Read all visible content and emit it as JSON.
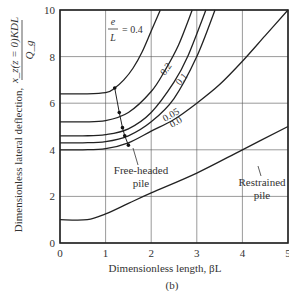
{
  "chart_data": {
    "type": "line",
    "panel_label": "(b)",
    "xlabel": "Dimensionless length, βL",
    "ylabel": "Dimensionless lateral deflection, x_z(z = 0)KDL / Q_g",
    "ylabel_text": "Dimensionless lateral deflection,",
    "ylabel_fraction_num": "x_z(z = 0)KDL",
    "ylabel_fraction_den": "Q_g",
    "xlim": [
      0,
      5
    ],
    "ylim": [
      0,
      10
    ],
    "xticks": [
      "0",
      "1",
      "2",
      "3",
      "4",
      "5"
    ],
    "yticks": [
      "0",
      "2",
      "4",
      "6",
      "8",
      "10"
    ],
    "grid": true,
    "param_label": "e/L = 0.4",
    "param_e": "e",
    "param_L": "L",
    "param_eq": "= 0.4",
    "annotations": [
      {
        "text": "Free-headed",
        "text2": "pile"
      },
      {
        "text": "Restrained",
        "text2": "pile"
      }
    ],
    "series": [
      {
        "name": "e/L = 0.4",
        "group": "Free-headed pile",
        "label": "0.4",
        "x": [
          0,
          0.5,
          1.0,
          1.2,
          1.4,
          1.6,
          1.8,
          2.0,
          2.2
        ],
        "y": [
          6.4,
          6.4,
          6.45,
          6.65,
          7.0,
          7.5,
          8.2,
          9.1,
          10.0
        ]
      },
      {
        "name": "e/L = 0.2",
        "group": "Free-headed pile",
        "label": "0.2",
        "x": [
          0,
          0.5,
          1.0,
          1.5,
          2.0,
          2.3,
          2.6,
          2.9
        ],
        "y": [
          5.2,
          5.2,
          5.25,
          5.6,
          6.5,
          7.4,
          8.5,
          10.0
        ]
      },
      {
        "name": "e/L = 0.1",
        "group": "Free-headed pile",
        "label": "0.1",
        "x": [
          0,
          0.5,
          1.0,
          1.5,
          2.0,
          2.5,
          2.8,
          3.2
        ],
        "y": [
          4.6,
          4.6,
          4.65,
          4.9,
          5.6,
          6.9,
          8.0,
          10.0
        ]
      },
      {
        "name": "e/L = 0.05",
        "group": "Free-headed pile",
        "label": "0.05",
        "x": [
          0,
          0.5,
          1.0,
          1.5,
          2.0,
          2.5,
          3.0,
          3.4
        ],
        "y": [
          4.3,
          4.3,
          4.35,
          4.6,
          5.2,
          6.2,
          8.0,
          10.0
        ]
      },
      {
        "name": "e/L = 0.0",
        "group": "Free-headed pile",
        "label": "0.0",
        "x": [
          0,
          0.5,
          1.0,
          1.5,
          2.0,
          2.5,
          3.0,
          3.5,
          4.0,
          4.5,
          5.0
        ],
        "y": [
          4.0,
          4.0,
          4.05,
          4.3,
          4.8,
          5.3,
          6.0,
          6.8,
          7.8,
          8.9,
          10.0
        ]
      },
      {
        "name": "Restrained pile",
        "group": "Restrained pile",
        "label": "",
        "x": [
          0,
          0.6,
          1.0,
          1.5,
          2.0,
          3.0,
          4.0,
          5.0
        ],
        "y": [
          1.0,
          1.0,
          1.25,
          1.7,
          2.15,
          3.0,
          4.0,
          5.0
        ]
      }
    ],
    "locus_points": {
      "name": "Free-headed pile locus",
      "x": [
        1.2,
        1.3,
        1.37,
        1.42,
        1.5
      ],
      "y": [
        6.65,
        5.6,
        4.95,
        4.6,
        4.2
      ]
    }
  }
}
